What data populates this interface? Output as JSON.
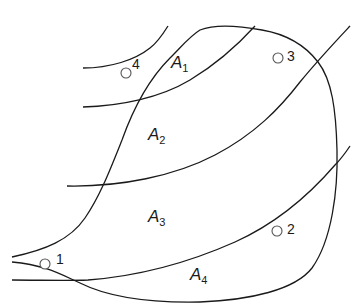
{
  "diagram": {
    "type": "contour-regions-with-catchment-boundary",
    "colors": {
      "line": "#1a1a1a",
      "point_stroke": "#555555",
      "background": "#ffffff"
    },
    "areas": [
      {
        "id": "A1",
        "letter": "A",
        "sub": "1"
      },
      {
        "id": "A2",
        "letter": "A",
        "sub": "2"
      },
      {
        "id": "A3",
        "letter": "A",
        "sub": "3"
      },
      {
        "id": "A4",
        "letter": "A",
        "sub": "4"
      }
    ],
    "points": [
      {
        "id": "1",
        "label": "1"
      },
      {
        "id": "2",
        "label": "2"
      },
      {
        "id": "3",
        "label": "3"
      },
      {
        "id": "4",
        "label": "4"
      }
    ],
    "contour_lines": 4,
    "boundary": "closed irregular loop"
  }
}
